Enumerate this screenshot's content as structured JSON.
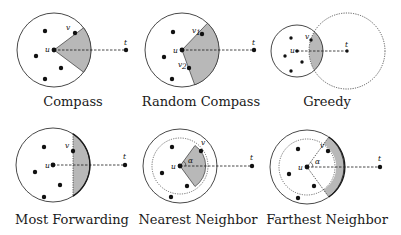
{
  "figure": {
    "panels": [
      {
        "id": "compass",
        "caption": "Compass",
        "labels": {
          "u": "u",
          "v": "v",
          "t": "t"
        }
      },
      {
        "id": "random-compass",
        "caption": "Random Compass",
        "labels": {
          "u": "u",
          "v1": "v",
          "v1_sub": "1",
          "v2": "v",
          "v2_sub": "2",
          "t": "t"
        }
      },
      {
        "id": "greedy",
        "caption": "Greedy",
        "labels": {
          "u": "u",
          "v": "v",
          "t": "t"
        }
      },
      {
        "id": "most-forwarding",
        "caption": "Most Forwarding",
        "labels": {
          "u": "u",
          "v": "v",
          "t": "t"
        }
      },
      {
        "id": "nearest-neighbor",
        "caption": "Nearest Neighbor",
        "labels": {
          "u": "u",
          "v": "v",
          "t": "t",
          "angle": "α"
        }
      },
      {
        "id": "farthest-neighbor",
        "caption": "Farthest Neighbor",
        "labels": {
          "u": "u",
          "v": "v",
          "t": "t",
          "angle": "α"
        }
      }
    ],
    "colors": {
      "shade": "#b8b8b8",
      "stroke": "#1a1a1a",
      "background": "#ffffff"
    }
  }
}
